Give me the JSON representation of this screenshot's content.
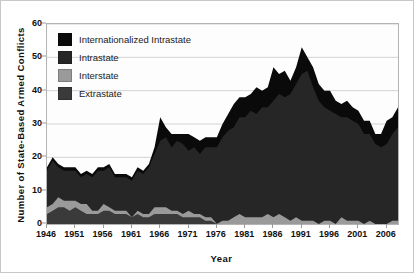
{
  "chart_data": {
    "type": "area",
    "stacked": true,
    "title": "",
    "xlabel": "Year",
    "ylabel": "Number of State-Based Armed Conflicts",
    "xlim": [
      1946,
      2008
    ],
    "ylim": [
      0,
      60
    ],
    "yticks": [
      0,
      10,
      20,
      30,
      40,
      50,
      60
    ],
    "xticks": [
      1946,
      1951,
      1956,
      1961,
      1966,
      1971,
      1976,
      1981,
      1986,
      1991,
      1996,
      2001,
      2006
    ],
    "grid": "horizontal",
    "legend_position": "top-left",
    "x": [
      1946,
      1947,
      1948,
      1949,
      1950,
      1951,
      1952,
      1953,
      1954,
      1955,
      1956,
      1957,
      1958,
      1959,
      1960,
      1961,
      1962,
      1963,
      1964,
      1965,
      1966,
      1967,
      1968,
      1969,
      1970,
      1971,
      1972,
      1973,
      1974,
      1975,
      1976,
      1977,
      1978,
      1979,
      1980,
      1981,
      1982,
      1983,
      1984,
      1985,
      1986,
      1987,
      1988,
      1989,
      1990,
      1991,
      1992,
      1993,
      1994,
      1995,
      1996,
      1997,
      1998,
      1999,
      2000,
      2001,
      2002,
      2003,
      2004,
      2005,
      2006,
      2007,
      2008
    ],
    "series": [
      {
        "name": "Extrastate",
        "color": "#3a3a3a",
        "values": [
          3,
          4,
          5,
          5,
          4,
          5,
          4,
          3,
          3,
          3,
          4,
          4,
          3,
          3,
          3,
          2,
          3,
          2,
          2,
          3,
          3,
          3,
          3,
          3,
          2,
          2,
          2,
          2,
          1,
          1,
          0,
          0,
          0,
          0,
          0,
          0,
          0,
          0,
          0,
          0,
          0,
          0,
          0,
          0,
          0,
          0,
          0,
          0,
          0,
          0,
          0,
          0,
          0,
          0,
          0,
          0,
          0,
          0,
          0,
          0,
          0,
          0,
          0
        ]
      },
      {
        "name": "Interstate",
        "color": "#9a9a9a",
        "values": [
          2,
          2,
          3,
          2,
          3,
          2,
          2,
          3,
          1,
          1,
          2,
          1,
          1,
          1,
          1,
          0,
          1,
          1,
          1,
          2,
          2,
          2,
          1,
          1,
          1,
          2,
          1,
          1,
          1,
          1,
          0,
          1,
          1,
          2,
          3,
          2,
          2,
          2,
          2,
          3,
          2,
          3,
          2,
          1,
          2,
          1,
          1,
          1,
          0,
          1,
          1,
          0,
          2,
          1,
          1,
          1,
          0,
          1,
          0,
          0,
          0,
          1,
          1
        ]
      },
      {
        "name": "Intrastate",
        "color": "#262626",
        "values": [
          11,
          13,
          9,
          9,
          9,
          9,
          8,
          9,
          10,
          12,
          10,
          12,
          10,
          10,
          10,
          11,
          12,
          12,
          14,
          16,
          20,
          21,
          19,
          21,
          21,
          18,
          20,
          18,
          21,
          21,
          23,
          25,
          27,
          27,
          29,
          30,
          32,
          31,
          33,
          32,
          35,
          36,
          36,
          38,
          40,
          44,
          45,
          40,
          37,
          34,
          33,
          33,
          30,
          31,
          30,
          29,
          27,
          26,
          24,
          23,
          24,
          26,
          28
        ]
      },
      {
        "name": "Internationalized Intrastate",
        "color": "#0a0a0a",
        "values": [
          1,
          1,
          1,
          1,
          1,
          1,
          1,
          1,
          1,
          1,
          1,
          1,
          1,
          1,
          1,
          1,
          1,
          1,
          1,
          2,
          7,
          3,
          4,
          2,
          3,
          5,
          3,
          4,
          3,
          3,
          3,
          4,
          5,
          7,
          6,
          6,
          5,
          8,
          5,
          6,
          10,
          6,
          8,
          4,
          5,
          8,
          4,
          6,
          5,
          5,
          6,
          4,
          4,
          5,
          4,
          4,
          4,
          4,
          3,
          4,
          7,
          5,
          6
        ]
      }
    ],
    "notes": {
      "peak_year": 1991,
      "peak_value": 53,
      "start_value_1946": 17,
      "end_value_2008": 35
    }
  },
  "legend": {
    "items": [
      {
        "label": "Internationalized Intrastate",
        "color": "#0a0a0a"
      },
      {
        "label": "Intrastate",
        "color": "#262626"
      },
      {
        "label": "Interstate",
        "color": "#9a9a9a"
      },
      {
        "label": "Extrastate",
        "color": "#3a3a3a"
      }
    ]
  }
}
